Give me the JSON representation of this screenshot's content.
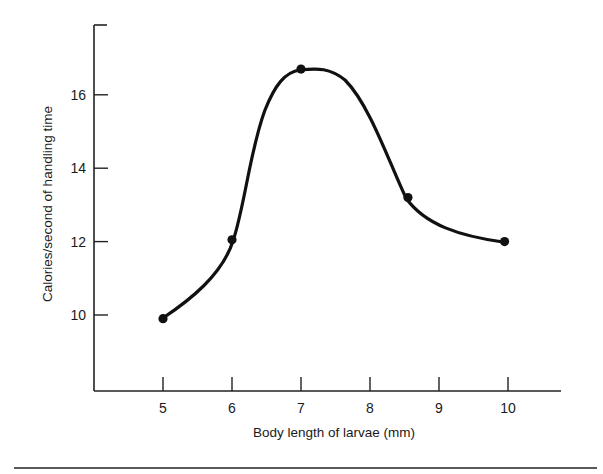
{
  "chart_data": {
    "type": "line",
    "title": "",
    "xlabel": "Body length of larvae (mm)",
    "ylabel": "Calories/second  of handling time",
    "x_ticks": [
      "5",
      "6",
      "7",
      "8",
      "9",
      "10"
    ],
    "y_ticks": [
      "10",
      "12",
      "14",
      "16"
    ],
    "xlim": [
      3.9,
      11.3
    ],
    "ylim": [
      8.1,
      18.9
    ],
    "grid": false,
    "legend": null,
    "smooth": true,
    "series": [
      {
        "name": "Calories per second of handling time",
        "x": [
          5,
          6,
          7,
          8.55,
          9.95
        ],
        "values": [
          9.9,
          12.05,
          16.7,
          13.2,
          12.0
        ],
        "marker": "filled-circle",
        "color": "#111111"
      }
    ]
  },
  "colors": {
    "ink": "#111111",
    "background": "#ffffff"
  }
}
